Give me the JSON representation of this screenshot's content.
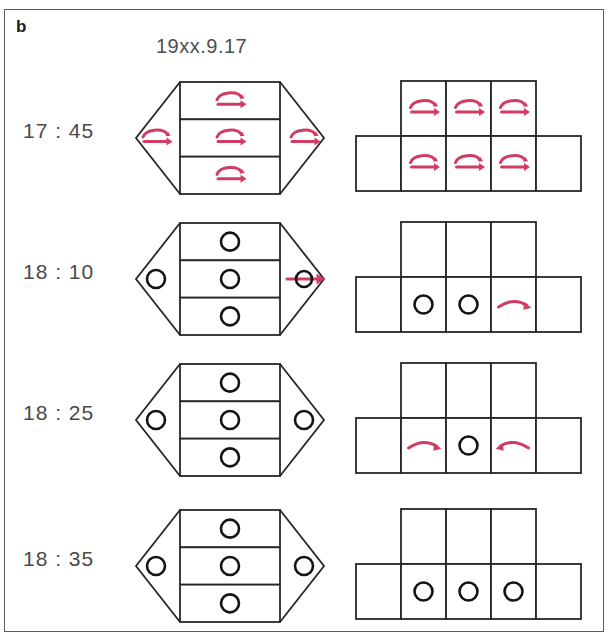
{
  "panel": {
    "letter": "b",
    "title": "19xx.9.17",
    "border_color": "#5a5a5a",
    "background": "#ffffff"
  },
  "colors": {
    "accent_red": "#d13d62",
    "line_dark": "#272727",
    "text_gray": "#4a4a4a",
    "letter_black": "#1c1c1c"
  },
  "legend": {
    "glyph_names": {
      "loop_arrow": "loop-arrow-icon",
      "circle": "circle-icon",
      "circle_through_arrow": "circle-through-arrow-icon",
      "arc_right": "arc-arrow-right-icon",
      "arc_left": "arc-arrow-left-icon",
      "empty": "empty-cell"
    }
  },
  "rows": [
    {
      "time": "17 : 45",
      "hexagon": {
        "left_point": "loop_arrow",
        "bands": [
          "loop_arrow",
          "loop_arrow",
          "loop_arrow"
        ],
        "right_point": "loop_arrow"
      },
      "grid": {
        "top": [
          "loop_arrow",
          "loop_arrow",
          "loop_arrow"
        ],
        "bottom": [
          "empty",
          "loop_arrow",
          "loop_arrow",
          "loop_arrow",
          "empty"
        ]
      }
    },
    {
      "time": "18 : 10",
      "hexagon": {
        "left_point": "circle",
        "bands": [
          "circle",
          "circle",
          "circle"
        ],
        "right_point": "circle_through_arrow"
      },
      "grid": {
        "top": [
          "empty",
          "empty",
          "empty"
        ],
        "bottom": [
          "empty",
          "circle",
          "circle",
          "arc_right",
          "empty"
        ]
      }
    },
    {
      "time": "18 : 25",
      "hexagon": {
        "left_point": "circle",
        "bands": [
          "circle",
          "circle",
          "circle"
        ],
        "right_point": "circle"
      },
      "grid": {
        "top": [
          "empty",
          "empty",
          "empty"
        ],
        "bottom": [
          "empty",
          "arc_right",
          "circle",
          "arc_left",
          "empty"
        ]
      }
    },
    {
      "time": "18 : 35",
      "hexagon": {
        "left_point": "circle",
        "bands": [
          "circle",
          "circle",
          "circle"
        ],
        "right_point": "circle"
      },
      "grid": {
        "top": [
          "empty",
          "empty",
          "empty"
        ],
        "bottom": [
          "empty",
          "circle",
          "circle",
          "circle",
          "empty"
        ]
      }
    }
  ]
}
